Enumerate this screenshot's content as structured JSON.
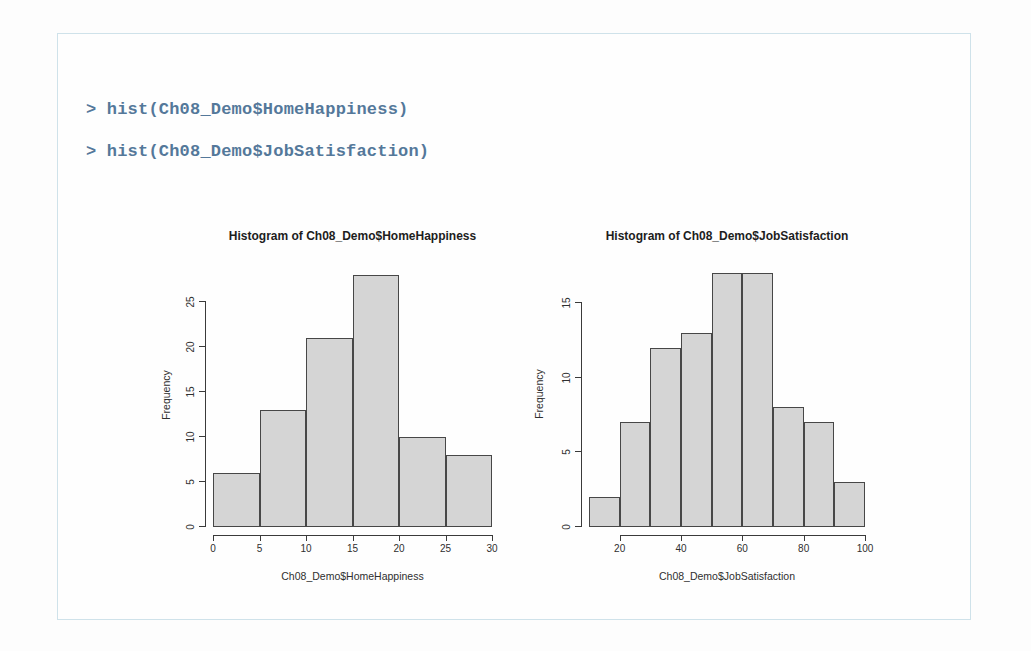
{
  "page": {
    "background": "#fdfdfd",
    "frame_border_color": "#cfe2ea"
  },
  "console": {
    "text_color": "#54789a",
    "lines": [
      "> hist(Ch08_Demo$HomeHappiness)",
      "> hist(Ch08_Demo$JobSatisfaction)"
    ]
  },
  "chart_data": [
    {
      "type": "bar",
      "title": "Histogram of Ch08_Demo$HomeHappiness",
      "xlabel": "Ch08_Demo$HomeHappiness",
      "ylabel": "Frequency",
      "bin_start": 0,
      "bin_width": 5,
      "values": [
        6,
        13,
        21,
        28,
        10,
        8
      ],
      "xlim": [
        0,
        30
      ],
      "ylim": [
        0,
        28
      ],
      "xticks": [
        0,
        5,
        10,
        15,
        20,
        25,
        30
      ],
      "yticks": [
        0,
        5,
        10,
        15,
        20,
        25
      ],
      "grid": false,
      "bar_fill": "#d5d5d5",
      "bar_border": "#474747"
    },
    {
      "type": "bar",
      "title": "Histogram of Ch08_Demo$JobSatisfaction",
      "xlabel": "Ch08_Demo$JobSatisfaction",
      "ylabel": "Frequency",
      "bin_start": 10,
      "bin_width": 10,
      "values": [
        2,
        7,
        12,
        13,
        17,
        17,
        8,
        7,
        3
      ],
      "xlim": [
        10,
        100
      ],
      "ylim": [
        0,
        17
      ],
      "xticks": [
        20,
        40,
        60,
        80,
        100
      ],
      "yticks": [
        0,
        5,
        10,
        15
      ],
      "grid": false,
      "bar_fill": "#d5d5d5",
      "bar_border": "#474747"
    }
  ]
}
